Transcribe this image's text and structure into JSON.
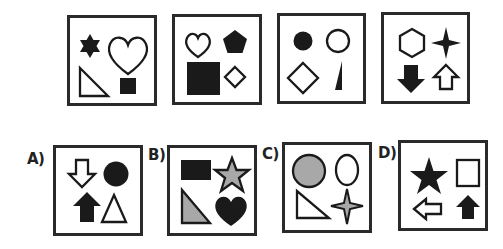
{
  "puzzle": {
    "sequence": [
      {
        "shapes": [
          "star-6-filled",
          "heart-outline",
          "right-triangle-outline",
          "square-filled"
        ]
      },
      {
        "shapes": [
          "heart-outline",
          "pentagon-filled",
          "square-filled",
          "diamond-outline"
        ]
      },
      {
        "shapes": [
          "circle-filled",
          "circle-outline",
          "diamond-outline",
          "thin-triangle-filled"
        ]
      },
      {
        "shapes": [
          "hexagon-outline",
          "star-4-filled",
          "arrow-down-filled",
          "arrow-up-outline"
        ]
      }
    ],
    "options": [
      {
        "label": "A)",
        "shapes": [
          "arrow-down-outline",
          "circle-filled",
          "arrow-up-filled",
          "triangle-outline"
        ]
      },
      {
        "label": "B)",
        "shapes": [
          "rectangle-filled",
          "star-5-gray",
          "right-triangle-gray",
          "heart-filled"
        ]
      },
      {
        "label": "C)",
        "shapes": [
          "circle-gray",
          "ellipse-outline",
          "right-triangle-outline",
          "star-4-gray"
        ]
      },
      {
        "label": "D)",
        "shapes": [
          "star-5-filled",
          "rectangle-outline",
          "arrow-left-outline",
          "arrow-up-filled"
        ]
      }
    ]
  },
  "colors": {
    "ink": "#1a1a1a",
    "border": "#2a2a2a",
    "gray_fill": "#a8a8a8",
    "background": "#ffffff"
  }
}
